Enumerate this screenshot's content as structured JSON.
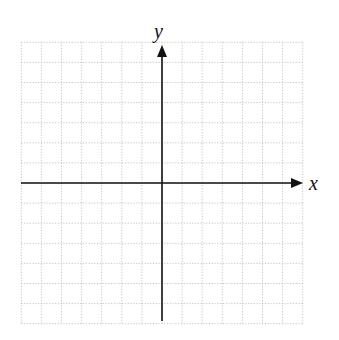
{
  "diagram": {
    "type": "coordinate-plane",
    "x_axis_label": "x",
    "y_axis_label": "y",
    "grid": {
      "columns_left_of_origin": 7,
      "columns_right_of_origin": 7,
      "rows_above_origin": 7,
      "rows_below_origin": 7,
      "line_style": "dotted"
    },
    "colors": {
      "grid": "#b8b8b8",
      "axis": "#111111",
      "background": "#ffffff"
    }
  }
}
